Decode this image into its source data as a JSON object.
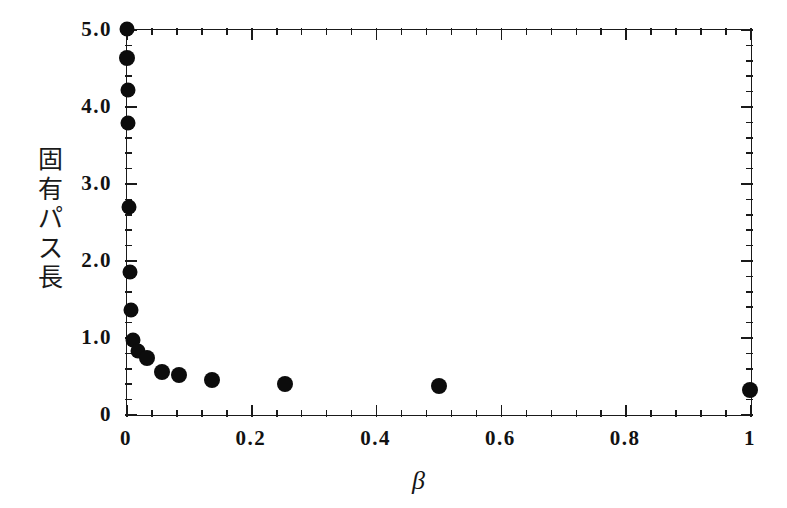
{
  "chart_data": {
    "type": "scatter",
    "title": "",
    "subtitle": "",
    "xlabel": "β",
    "ylabel": "固有パス長",
    "ylabel_chars": [
      "固",
      "有",
      "パ",
      "ス",
      "長"
    ],
    "xlim": [
      0,
      1
    ],
    "ylim": [
      0,
      5
    ],
    "grid": false,
    "legend": null,
    "legend_position": "none",
    "xtick_labels": [
      "0",
      "0.2",
      "0.4",
      "0.6",
      "0.8",
      "1"
    ],
    "xtick_values": [
      0,
      0.2,
      0.4,
      0.6,
      0.8,
      1
    ],
    "xminor_per_major": 5,
    "ytick_labels": [
      "0",
      "1.0",
      "2.0",
      "3.0",
      "4.0",
      "5.0"
    ],
    "ytick_values": [
      0,
      1,
      2,
      3,
      4,
      5
    ],
    "yminor_per_major": 5,
    "marker": "filled-circle",
    "marker_color": "#0c0c0c",
    "marker_size_px": 15,
    "frame_color": "#1a1a1a",
    "series": [
      {
        "name": "固有パス長",
        "x": [
          0.0001,
          0.0002,
          0.0004,
          0.0008,
          0.0016,
          0.0031,
          0.005,
          0.008,
          0.013,
          0.021,
          0.035,
          0.062,
          0.12,
          0.25,
          0.5,
          1.0
        ],
        "y": [
          5.0,
          4.62,
          4.2,
          3.78,
          2.7,
          1.86,
          1.35,
          0.96,
          0.8,
          0.72,
          0.5,
          0.47,
          0.4,
          0.35,
          0.33,
          0.31
        ]
      }
    ],
    "points_pixel": [
      {
        "px": 127,
        "py": 29,
        "r": 7.5
      },
      {
        "px": 127,
        "py": 58,
        "r": 8.0
      },
      {
        "px": 128,
        "py": 90,
        "r": 7.5
      },
      {
        "px": 128,
        "py": 123,
        "r": 7.5
      },
      {
        "px": 129,
        "py": 207,
        "r": 7.5
      },
      {
        "px": 130,
        "py": 272,
        "r": 7.5
      },
      {
        "px": 131,
        "py": 310,
        "r": 7.5
      },
      {
        "px": 133,
        "py": 340,
        "r": 7.5
      },
      {
        "px": 138,
        "py": 351,
        "r": 7.5
      },
      {
        "px": 147,
        "py": 358,
        "r": 8.0
      },
      {
        "px": 162,
        "py": 372,
        "r": 8.0
      },
      {
        "px": 179,
        "py": 375,
        "r": 8.0
      },
      {
        "px": 212,
        "py": 380,
        "r": 8.0
      },
      {
        "px": 285,
        "py": 384,
        "r": 8.0
      },
      {
        "px": 439,
        "py": 386,
        "r": 8.0
      },
      {
        "px": 750,
        "py": 390,
        "r": 8.0
      }
    ]
  }
}
